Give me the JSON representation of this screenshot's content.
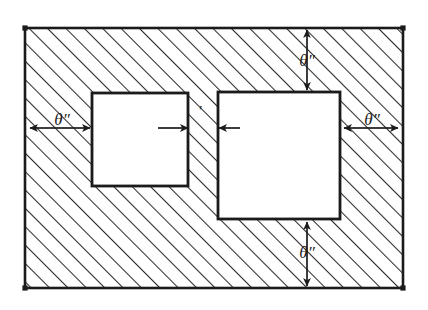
{
  "figure": {
    "type": "technical-line-drawing",
    "style": "hand-drawn ink sketch",
    "colors": {
      "ink": "#1b1b1b",
      "hatch": "#2a2a2a",
      "paper": "#ffffff",
      "cavity_fill": "#ffffff"
    }
  },
  "canvas": {
    "width": 428,
    "height": 310
  },
  "frame": {
    "name": "outer-boundary",
    "x": 25,
    "y": 28,
    "width": 378,
    "height": 260,
    "hatch_angle_deg": 45,
    "hatch_spacing_px": 13,
    "corner_markers": 4
  },
  "cavities": [
    {
      "name": "left-square",
      "x": 92,
      "y": 93,
      "width": 96,
      "height": 93
    },
    {
      "name": "right-square",
      "x": 218,
      "y": 92,
      "width": 122,
      "height": 127
    }
  ],
  "annotations": {
    "left_gap": {
      "label": "θ″",
      "x": 62,
      "y": 128,
      "arrow_from_x": 30,
      "arrow_to_x": 90,
      "axis": "horizontal"
    },
    "right_gap": {
      "label": "θ″",
      "x": 372,
      "y": 128,
      "arrow_from_x": 398,
      "arrow_to_x": 344,
      "axis": "horizontal"
    },
    "center_gap": {
      "label": "′",
      "x": 200,
      "y": 116,
      "arrow_left_from_x": 158,
      "arrow_left_to_x": 188,
      "arrow_right_from_x": 240,
      "arrow_right_to_x": 219,
      "axis": "horizontal"
    },
    "top_gap": {
      "label": "θ″",
      "x": 307,
      "y": 60,
      "arrow_from_y": 30,
      "arrow_to_y": 90,
      "axis": "vertical"
    },
    "bottom_gap": {
      "label": "θ″",
      "x": 307,
      "y": 252,
      "arrow_from_y": 286,
      "arrow_to_y": 222,
      "axis": "vertical"
    }
  }
}
